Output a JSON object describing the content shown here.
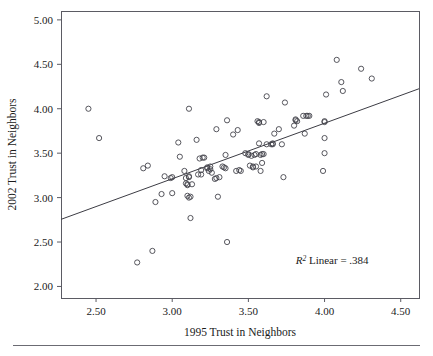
{
  "figure": {
    "background_color": "#ffffff",
    "frame_color": "#5b5b63",
    "marker_color": "#44444c",
    "line_color": "#3c3c44",
    "rule_color": "#6b6b73"
  },
  "axes": {
    "x_title": "1995 Trust in Neighbors",
    "y_title": "2002 Trust in Neighbors",
    "x_ticks": [
      "2.50",
      "3.00",
      "3.50",
      "4.00",
      "4.50"
    ],
    "y_ticks": [
      "2.00",
      "2.50",
      "3.00",
      "3.50",
      "4.00",
      "4.50",
      "5.00"
    ]
  },
  "annotation": {
    "r2_italic": "R",
    "r2_sup": "2",
    "r2_text": " Linear = .384"
  },
  "chart_data": {
    "type": "scatter",
    "title": "",
    "xlabel": "1995 Trust in Neighbors",
    "ylabel": "2002 Trust in Neighbors",
    "xlim": [
      2.27,
      4.62
    ],
    "ylim": [
      1.87,
      5.1
    ],
    "xticks": [
      2.5,
      3.0,
      3.5,
      4.0,
      4.5
    ],
    "yticks": [
      2.0,
      2.5,
      3.0,
      3.5,
      4.0,
      4.5,
      5.0
    ],
    "grid": false,
    "legend": false,
    "annotations": [
      {
        "text": "R² Linear = .384",
        "x": 4.05,
        "y": 2.25
      }
    ],
    "fit_line": {
      "type": "linear",
      "r_squared": 0.384,
      "endpoints": [
        [
          2.27,
          2.755
        ],
        [
          4.62,
          4.225
        ]
      ],
      "slope": 0.6255,
      "intercept": 1.335
    },
    "series": [
      {
        "name": "respondents",
        "marker": "open-circle",
        "n": 104,
        "points": [
          [
            2.45,
            4.0
          ],
          [
            2.52,
            3.67
          ],
          [
            2.77,
            2.27
          ],
          [
            2.81,
            3.33
          ],
          [
            2.84,
            3.36
          ],
          [
            2.87,
            2.4
          ],
          [
            2.89,
            2.95
          ],
          [
            2.93,
            3.04
          ],
          [
            2.95,
            3.24
          ],
          [
            2.99,
            3.22
          ],
          [
            3.0,
            3.23
          ],
          [
            3.0,
            3.05
          ],
          [
            3.04,
            3.62
          ],
          [
            3.05,
            3.46
          ],
          [
            3.08,
            3.3
          ],
          [
            3.09,
            3.22
          ],
          [
            3.09,
            3.16
          ],
          [
            3.1,
            3.14
          ],
          [
            3.1,
            3.02
          ],
          [
            3.11,
            3.0
          ],
          [
            3.11,
            4.0
          ],
          [
            3.11,
            3.24
          ],
          [
            3.12,
            2.77
          ],
          [
            3.16,
            3.65
          ],
          [
            3.17,
            3.26
          ],
          [
            3.18,
            3.44
          ],
          [
            3.19,
            3.31
          ],
          [
            3.21,
            3.45
          ],
          [
            3.23,
            3.33
          ],
          [
            3.24,
            3.3
          ],
          [
            3.25,
            3.35
          ],
          [
            3.26,
            3.28
          ],
          [
            3.28,
            3.21
          ],
          [
            3.29,
            3.77
          ],
          [
            3.3,
            3.01
          ],
          [
            3.31,
            3.23
          ],
          [
            3.33,
            3.35
          ],
          [
            3.34,
            3.34
          ],
          [
            3.35,
            3.48
          ],
          [
            3.36,
            2.5
          ],
          [
            3.36,
            3.87
          ],
          [
            3.4,
            3.71
          ],
          [
            3.42,
            3.3
          ],
          [
            3.43,
            3.76
          ],
          [
            3.44,
            3.31
          ],
          [
            3.48,
            3.5
          ],
          [
            3.5,
            3.49
          ],
          [
            3.51,
            3.36
          ],
          [
            3.52,
            3.47
          ],
          [
            3.53,
            3.34
          ],
          [
            3.54,
            3.48
          ],
          [
            3.55,
            3.49
          ],
          [
            3.56,
            3.86
          ],
          [
            3.57,
            3.84
          ],
          [
            3.57,
            3.61
          ],
          [
            3.58,
            3.3
          ],
          [
            3.59,
            3.39
          ],
          [
            3.6,
            3.49
          ],
          [
            3.6,
            3.85
          ],
          [
            3.62,
            4.14
          ],
          [
            3.65,
            3.6
          ],
          [
            3.66,
            3.6
          ],
          [
            3.67,
            3.72
          ],
          [
            3.7,
            3.77
          ],
          [
            3.72,
            3.6
          ],
          [
            3.73,
            3.23
          ],
          [
            3.74,
            4.07
          ],
          [
            3.8,
            3.81
          ],
          [
            3.81,
            3.87
          ],
          [
            3.82,
            3.86
          ],
          [
            3.86,
            3.92
          ],
          [
            3.87,
            3.72
          ],
          [
            3.89,
            3.92
          ],
          [
            3.9,
            3.92
          ],
          [
            3.99,
            3.3
          ],
          [
            4.0,
            3.5
          ],
          [
            4.0,
            3.67
          ],
          [
            4.0,
            3.85
          ],
          [
            4.01,
            4.16
          ],
          [
            4.08,
            4.55
          ],
          [
            4.11,
            4.3
          ],
          [
            4.12,
            4.2
          ],
          [
            4.24,
            4.45
          ],
          [
            4.31,
            4.34
          ],
          [
            3.13,
            3.15
          ],
          [
            3.2,
            3.45
          ],
          [
            3.25,
            3.32
          ],
          [
            3.35,
            3.33
          ],
          [
            3.55,
            3.35
          ],
          [
            3.58,
            3.48
          ],
          [
            3.62,
            3.6
          ],
          [
            3.81,
            3.88
          ],
          [
            3.57,
            3.85
          ],
          [
            3.12,
            3.01
          ],
          [
            3.23,
            3.34
          ],
          [
            3.5,
            3.48
          ],
          [
            3.66,
            3.61
          ],
          [
            3.1,
            3.15
          ],
          [
            3.29,
            3.22
          ],
          [
            3.45,
            3.3
          ],
          [
            3.53,
            3.35
          ],
          [
            3.59,
            3.49
          ],
          [
            3.88,
            3.92
          ],
          [
            4.0,
            3.86
          ],
          [
            3.11,
            3.23
          ],
          [
            3.19,
            3.26
          ]
        ]
      }
    ]
  }
}
